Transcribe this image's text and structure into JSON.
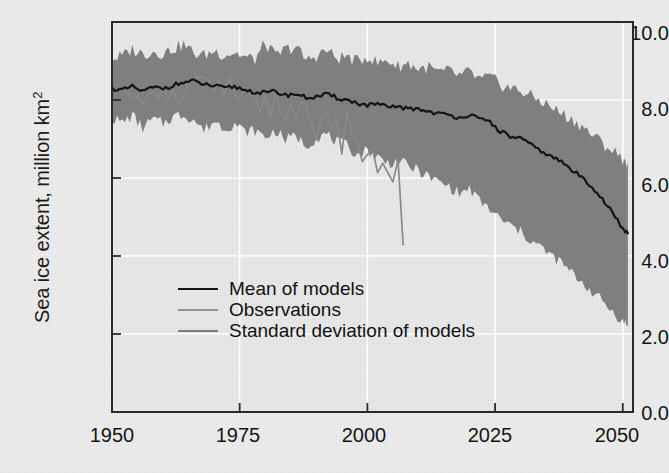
{
  "chart_data": {
    "type": "area",
    "title": "",
    "xlabel": "",
    "ylabel": "Sea ice extent, million km",
    "ylabel_superscript": "2",
    "xlim": [
      1950,
      2052
    ],
    "ylim": [
      0.0,
      10.0
    ],
    "grid": true,
    "grid_color": "#ffffff",
    "plot_bg": "#e7e7e7",
    "figure_bg": "#ebebeb",
    "axis_color": "#2a2a2a",
    "xticks": [
      1950,
      1975,
      2000,
      2025,
      2050
    ],
    "xtick_labels": [
      "1950",
      "1975",
      "2000",
      "2025",
      "2050"
    ],
    "yticks": [
      0.0,
      2.0,
      4.0,
      6.0,
      8.0,
      10.0
    ],
    "ytick_labels": [
      "0.0",
      "2.0",
      "4.0",
      "6.0",
      "8.0",
      "10.0"
    ],
    "legend_position": "center-left",
    "series": [
      {
        "name": "Mean of models",
        "key": "mean",
        "type": "line",
        "color": "#141414",
        "width": 2.2,
        "x": [
          1950,
          1952,
          1954,
          1956,
          1958,
          1960,
          1962,
          1964,
          1966,
          1968,
          1970,
          1972,
          1974,
          1976,
          1978,
          1980,
          1982,
          1984,
          1986,
          1988,
          1990,
          1992,
          1994,
          1996,
          1998,
          2000,
          2002,
          2004,
          2006,
          2008,
          2010,
          2012,
          2014,
          2016,
          2018,
          2020,
          2022,
          2024,
          2026,
          2028,
          2030,
          2032,
          2034,
          2036,
          2038,
          2040,
          2042,
          2044,
          2046,
          2048,
          2050,
          2051
        ],
        "values": [
          8.3,
          8.25,
          8.34,
          8.22,
          8.32,
          8.3,
          8.38,
          8.45,
          8.48,
          8.4,
          8.36,
          8.3,
          8.34,
          8.26,
          8.2,
          8.18,
          8.22,
          8.12,
          8.16,
          8.06,
          8.08,
          8.14,
          8.06,
          8.0,
          7.92,
          7.86,
          7.9,
          7.8,
          7.84,
          7.76,
          7.78,
          7.7,
          7.66,
          7.6,
          7.56,
          7.62,
          7.5,
          7.44,
          7.2,
          7.06,
          7.02,
          6.84,
          6.7,
          6.54,
          6.42,
          6.2,
          6.02,
          5.78,
          5.46,
          5.1,
          4.7,
          4.58
        ]
      },
      {
        "name": "Observations",
        "key": "observations",
        "type": "line",
        "color": "#8a8a8a",
        "width": 1.7,
        "x": [
          1953,
          1954,
          1955,
          1956,
          1957,
          1958,
          1959,
          1960,
          1961,
          1962,
          1963,
          1964,
          1965,
          1966,
          1967,
          1968,
          1969,
          1970,
          1971,
          1972,
          1973,
          1974,
          1975,
          1976,
          1977,
          1978,
          1979,
          1980,
          1981,
          1982,
          1983,
          1984,
          1985,
          1986,
          1987,
          1988,
          1989,
          1990,
          1991,
          1992,
          1993,
          1994,
          1995,
          1996,
          1997,
          1998,
          1999,
          2000,
          2001,
          2002,
          2003,
          2004,
          2005,
          2006,
          2007
        ],
        "values": [
          8.22,
          8.0,
          8.1,
          7.88,
          8.14,
          8.22,
          8.04,
          8.3,
          8.02,
          8.24,
          7.86,
          8.12,
          8.42,
          8.56,
          8.6,
          8.6,
          8.5,
          8.24,
          8.56,
          8.12,
          8.58,
          8.16,
          8.0,
          8.32,
          8.16,
          8.1,
          7.7,
          8.12,
          7.54,
          8.18,
          7.66,
          7.5,
          7.86,
          7.54,
          7.96,
          7.88,
          7.44,
          6.98,
          7.56,
          7.7,
          7.28,
          7.52,
          6.62,
          7.74,
          7.12,
          6.9,
          6.42,
          6.6,
          6.74,
          6.14,
          6.38,
          6.14,
          5.9,
          6.46,
          4.28
        ]
      },
      {
        "name": "Standard deviation of models",
        "key": "stddev_band",
        "type": "band",
        "color": "#808080",
        "x": [
          1950,
          1952,
          1954,
          1956,
          1958,
          1960,
          1962,
          1964,
          1966,
          1968,
          1970,
          1972,
          1974,
          1976,
          1978,
          1980,
          1982,
          1984,
          1986,
          1988,
          1990,
          1992,
          1994,
          1996,
          1998,
          2000,
          2002,
          2004,
          2006,
          2008,
          2010,
          2012,
          2014,
          2016,
          2018,
          2020,
          2022,
          2024,
          2026,
          2028,
          2030,
          2032,
          2034,
          2036,
          2038,
          2040,
          2042,
          2044,
          2046,
          2048,
          2050,
          2051
        ],
        "upper": [
          9.06,
          9.12,
          9.3,
          9.18,
          9.24,
          9.2,
          9.32,
          9.42,
          9.2,
          9.14,
          9.26,
          9.16,
          9.22,
          9.1,
          9.04,
          9.46,
          9.12,
          9.3,
          9.36,
          9.02,
          9.14,
          9.28,
          9.06,
          9.12,
          8.98,
          9.12,
          8.94,
          9.02,
          8.86,
          8.94,
          8.8,
          8.84,
          8.7,
          8.74,
          8.62,
          8.72,
          8.52,
          8.58,
          8.4,
          8.3,
          8.24,
          8.1,
          7.98,
          7.82,
          7.66,
          7.5,
          7.34,
          7.1,
          6.9,
          6.7,
          6.5,
          6.4
        ],
        "lower": [
          7.54,
          7.42,
          7.6,
          7.28,
          7.5,
          7.4,
          7.58,
          7.62,
          7.5,
          7.22,
          7.46,
          7.28,
          7.4,
          7.18,
          7.22,
          7.04,
          7.22,
          6.98,
          7.08,
          6.84,
          7.02,
          7.12,
          6.92,
          6.82,
          6.6,
          6.72,
          6.54,
          6.38,
          6.44,
          6.3,
          6.2,
          6.02,
          5.9,
          5.78,
          5.6,
          5.72,
          5.4,
          5.2,
          4.94,
          4.78,
          4.62,
          4.4,
          4.22,
          4.0,
          3.82,
          3.56,
          3.34,
          3.08,
          2.84,
          2.58,
          2.32,
          2.22
        ]
      }
    ]
  },
  "legend": {
    "items": [
      {
        "label": "Mean of models",
        "color": "#141414",
        "width": 2.6
      },
      {
        "label": "Observations",
        "color": "#949494",
        "width": 2.2
      },
      {
        "label": "Standard deviation of models",
        "color": "#7d7d7d",
        "width": 2.6
      }
    ]
  }
}
